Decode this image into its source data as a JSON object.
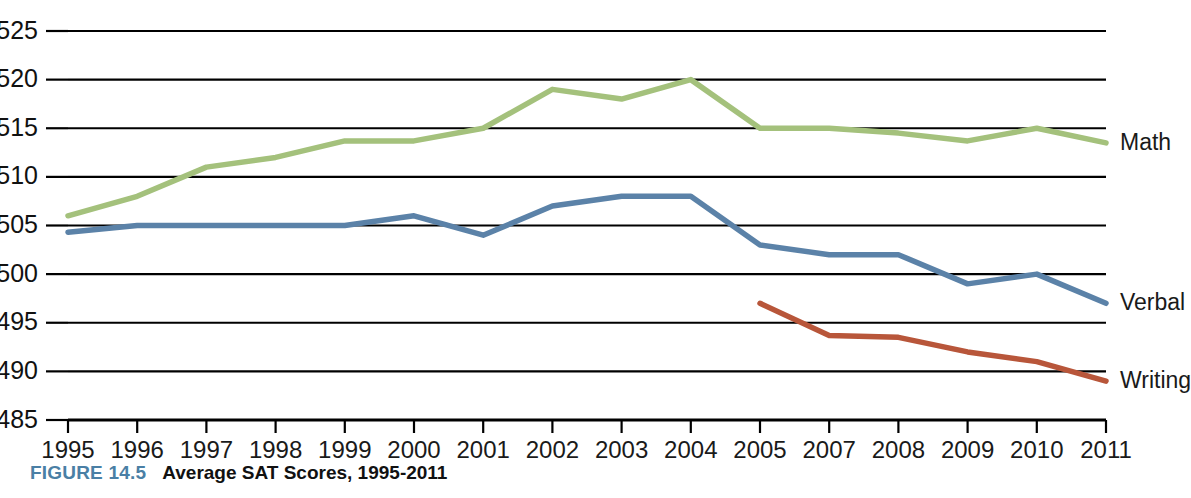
{
  "figure": {
    "number_label": "FIGURE 14.5",
    "title": "Average SAT Scores, 1995-2011"
  },
  "colors": {
    "math": "#a4c17c",
    "verbal": "#5b82a8",
    "writing": "#b8563a",
    "gridline": "#000000",
    "text": "#111111",
    "figure_number": "#4a7fa5",
    "background": "#ffffff"
  },
  "axes": {
    "y_ticks": [
      "525",
      "520",
      "515",
      "510",
      "505",
      "500",
      "495",
      "490",
      "485"
    ],
    "x_ticks": [
      "1995",
      "1996",
      "1997",
      "1998",
      "1999",
      "2000",
      "2001",
      "2002",
      "2003",
      "2004",
      "2005",
      "2007",
      "2008",
      "2009",
      "2010",
      "2011"
    ],
    "ylim": [
      485,
      525
    ],
    "y_step": 5,
    "grid": true,
    "xlabel": "",
    "ylabel": ""
  },
  "series_labels": {
    "math": "Math",
    "verbal": "Verbal",
    "writing": "Writing"
  },
  "chart_data": {
    "type": "line",
    "title": "Average SAT Scores, 1995-2011",
    "xlabel": "",
    "ylabel": "",
    "ylim": [
      485,
      525
    ],
    "grid": true,
    "legend_position": "right-inline",
    "categories": [
      "1995",
      "1996",
      "1997",
      "1998",
      "1999",
      "2000",
      "2001",
      "2002",
      "2003",
      "2004",
      "2005",
      "2007",
      "2008",
      "2009",
      "2010",
      "2011"
    ],
    "series": [
      {
        "name": "Math",
        "color": "#a4c17c",
        "values": [
          506,
          508,
          511,
          512,
          513.7,
          513.7,
          515,
          519,
          518,
          520,
          515,
          515,
          514.5,
          513.7,
          515,
          513.5
        ]
      },
      {
        "name": "Verbal",
        "color": "#5b82a8",
        "values": [
          504.3,
          505,
          505,
          505,
          505,
          506,
          504,
          507,
          508,
          508,
          503,
          502,
          502,
          499,
          500,
          497
        ]
      },
      {
        "name": "Writing",
        "color": "#b8563a",
        "values": [
          null,
          null,
          null,
          null,
          null,
          null,
          null,
          null,
          null,
          null,
          497,
          493.7,
          493.5,
          492,
          491,
          489
        ]
      }
    ]
  }
}
